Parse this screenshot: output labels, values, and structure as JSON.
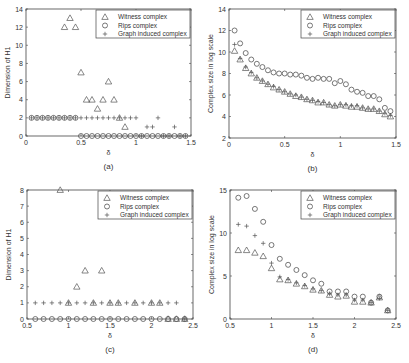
{
  "figure": {
    "panels": [
      "a",
      "b",
      "c",
      "d"
    ]
  },
  "chart_data": [
    {
      "id": "a",
      "type": "scatter",
      "caption": "(a)",
      "xlabel": "δ",
      "ylabel": "Dimension of H1",
      "xlim": [
        0,
        1.5
      ],
      "ylim": [
        0,
        14
      ],
      "xticks": [
        0,
        0.5,
        1,
        1.5
      ],
      "xtick_labels": [
        "0",
        "0.5",
        "1",
        "1.5"
      ],
      "yticks": [
        0,
        2,
        4,
        6,
        8,
        10,
        12,
        14
      ],
      "ytick_labels": [
        "0",
        "2",
        "4",
        "6",
        "8",
        "10",
        "12",
        "14"
      ],
      "legend_position": "upper right",
      "box": {
        "left": 26,
        "top": 9,
        "right": 191,
        "bottom": 136
      },
      "series": [
        {
          "name": "Witness complex",
          "marker": "triangle",
          "x": [
            0.35,
            0.4,
            0.45,
            0.5,
            0.55,
            0.6,
            0.65,
            0.7,
            0.75,
            0.8,
            0.85,
            0.9
          ],
          "y": [
            12,
            13,
            12,
            7,
            4,
            4,
            3,
            4,
            6,
            4,
            2,
            1
          ]
        },
        {
          "name": "Rips complex",
          "marker": "circle",
          "x": [
            0.05,
            0.1,
            0.15,
            0.2,
            0.25,
            0.3,
            0.35,
            0.4,
            0.45,
            0.5,
            0.55,
            0.6,
            0.65,
            0.7,
            0.75,
            0.8,
            0.85,
            0.9,
            0.95,
            1.0,
            1.05,
            1.1,
            1.15,
            1.2,
            1.25,
            1.3,
            1.35,
            1.4,
            1.45
          ],
          "y": [
            2,
            2,
            2,
            2,
            2,
            2,
            2,
            2,
            2,
            0,
            0,
            0,
            0,
            0,
            0,
            0,
            0,
            0,
            0,
            0,
            0,
            0,
            0,
            0,
            0,
            0,
            0,
            0,
            0
          ]
        },
        {
          "name": "Graph induced complex",
          "marker": "plus",
          "x": [
            0.05,
            0.1,
            0.15,
            0.2,
            0.25,
            0.3,
            0.35,
            0.4,
            0.45,
            0.5,
            0.55,
            0.6,
            0.65,
            0.7,
            0.75,
            0.8,
            0.85,
            0.9,
            0.95,
            1.0,
            1.05,
            1.1,
            1.15,
            1.2,
            1.25,
            1.3,
            1.35,
            1.4,
            1.45
          ],
          "y": [
            2,
            2,
            2,
            2,
            2,
            2,
            2,
            2,
            2,
            2,
            2,
            2,
            2,
            2,
            2,
            2,
            2,
            2,
            2,
            2,
            0,
            1,
            1,
            2,
            0,
            0,
            1,
            0,
            0
          ]
        }
      ]
    },
    {
      "id": "b",
      "type": "scatter",
      "caption": "(b)",
      "xlabel": "δ",
      "ylabel": "Complex size in log scale",
      "xlim": [
        0,
        1.5
      ],
      "ylim": [
        2,
        14
      ],
      "xticks": [
        0,
        0.5,
        1,
        1.5
      ],
      "xtick_labels": [
        "0",
        "0.5",
        "1",
        "1.5"
      ],
      "yticks": [
        2,
        4,
        6,
        8,
        10,
        12,
        14
      ],
      "ytick_labels": [
        "2",
        "4",
        "6",
        "8",
        "10",
        "12",
        "14"
      ],
      "legend_position": "upper right",
      "box": {
        "left": 229,
        "top": 9,
        "right": 396,
        "bottom": 138
      },
      "series": [
        {
          "name": "Witness complex",
          "marker": "triangle",
          "x": [
            0.05,
            0.1,
            0.15,
            0.2,
            0.25,
            0.3,
            0.35,
            0.4,
            0.45,
            0.5,
            0.55,
            0.6,
            0.65,
            0.7,
            0.75,
            0.8,
            0.85,
            0.9,
            0.95,
            1.0,
            1.05,
            1.1,
            1.15,
            1.2,
            1.25,
            1.3,
            1.35,
            1.4,
            1.45
          ],
          "y": [
            10.1,
            9.3,
            8.5,
            8.0,
            7.6,
            7.3,
            7.0,
            6.7,
            6.5,
            6.3,
            6.1,
            5.9,
            5.8,
            5.6,
            5.5,
            5.3,
            5.3,
            5.1,
            5.0,
            5.1,
            5.0,
            4.9,
            4.9,
            4.8,
            4.7,
            4.7,
            4.5,
            4.2,
            4.0
          ]
        },
        {
          "name": "Rips complex",
          "marker": "circle",
          "x": [
            0.05,
            0.1,
            0.15,
            0.2,
            0.25,
            0.3,
            0.35,
            0.4,
            0.45,
            0.5,
            0.55,
            0.6,
            0.65,
            0.7,
            0.75,
            0.8,
            0.85,
            0.9,
            0.95,
            1.0,
            1.05,
            1.1,
            1.15,
            1.2,
            1.25,
            1.3,
            1.35,
            1.4,
            1.45
          ],
          "y": [
            12.0,
            10.8,
            9.9,
            9.3,
            8.9,
            8.6,
            8.3,
            8.1,
            8.0,
            8.0,
            7.9,
            7.9,
            7.8,
            7.6,
            7.5,
            7.6,
            7.5,
            7.5,
            7.1,
            7.3,
            7.0,
            6.5,
            6.3,
            6.2,
            5.9,
            5.9,
            5.6,
            4.8,
            4.5
          ]
        },
        {
          "name": "Graph induced complex",
          "marker": "plus",
          "x": [
            0.05,
            0.1,
            0.15,
            0.2,
            0.25,
            0.3,
            0.35,
            0.4,
            0.45,
            0.5,
            0.55,
            0.6,
            0.65,
            0.7,
            0.75,
            0.8,
            0.85,
            0.9,
            0.95,
            1.0,
            1.05,
            1.1,
            1.15,
            1.2,
            1.25,
            1.3,
            1.35,
            1.4,
            1.45
          ],
          "y": [
            10.7,
            9.4,
            8.6,
            8.1,
            7.6,
            7.3,
            7.0,
            6.8,
            6.5,
            6.3,
            6.1,
            6.0,
            5.8,
            5.6,
            5.5,
            5.4,
            5.3,
            5.1,
            5.0,
            5.1,
            5.1,
            5.0,
            5.0,
            4.8,
            4.7,
            4.7,
            4.5,
            4.3,
            4.1
          ]
        }
      ]
    },
    {
      "id": "c",
      "type": "scatter",
      "caption": "(c)",
      "xlabel": "δ",
      "ylabel": "Dimension of H1",
      "xlim": [
        0.5,
        2.5
      ],
      "ylim": [
        0,
        8
      ],
      "xticks": [
        0.5,
        1,
        1.5,
        2,
        2.5
      ],
      "xtick_labels": [
        "0.5",
        "1",
        "1.5",
        "2",
        "2.5"
      ],
      "yticks": [
        0,
        1,
        2,
        3,
        4,
        5,
        6,
        7,
        8
      ],
      "ytick_labels": [
        "0",
        "1",
        "2",
        "3",
        "4",
        "5",
        "6",
        "7",
        "8"
      ],
      "legend_position": "upper right",
      "box": {
        "left": 27,
        "top": 190,
        "right": 193,
        "bottom": 319
      },
      "series": [
        {
          "name": "Witness complex",
          "marker": "triangle",
          "x": [
            0.9,
            1.0,
            1.1,
            1.2,
            1.3,
            1.4,
            1.5,
            1.6,
            1.8,
            2.0,
            2.1,
            2.2,
            2.3,
            2.4
          ],
          "y": [
            8,
            1,
            2,
            3,
            1,
            3,
            1,
            1,
            1,
            1,
            1,
            0,
            0,
            0
          ]
        },
        {
          "name": "Rips complex",
          "marker": "circle",
          "x": [
            0.6,
            0.7,
            0.8,
            0.9,
            1.0,
            1.1,
            1.2,
            1.3,
            1.4,
            1.5,
            1.6,
            1.7,
            1.8,
            1.9,
            2.0,
            2.1,
            2.2,
            2.3,
            2.4
          ],
          "y": [
            0,
            0,
            0,
            0,
            0,
            0,
            0,
            0,
            0,
            0,
            0,
            0,
            0,
            0,
            0,
            0,
            0,
            0,
            0
          ]
        },
        {
          "name": "Graph induced complex",
          "marker": "plus",
          "x": [
            0.6,
            0.7,
            0.8,
            0.9,
            1.0,
            1.1,
            1.2,
            1.3,
            1.4,
            1.5,
            1.6,
            1.7,
            1.8,
            1.9,
            2.0,
            2.1,
            2.2,
            2.3,
            2.4
          ],
          "y": [
            1,
            1,
            1,
            1,
            1,
            1,
            1,
            1,
            1,
            1,
            1,
            1,
            1,
            1,
            1,
            1,
            1,
            1,
            0
          ]
        }
      ]
    },
    {
      "id": "d",
      "type": "scatter",
      "caption": "(d)",
      "xlabel": "δ",
      "ylabel": "Complex size in log scale",
      "xlim": [
        0.5,
        2.5
      ],
      "ylim": [
        0,
        15
      ],
      "xticks": [
        0.5,
        1,
        1.5,
        2,
        2.5
      ],
      "xtick_labels": [
        "0.5",
        "1",
        "1.5",
        "2",
        "2.5"
      ],
      "yticks": [
        0,
        5,
        10,
        15
      ],
      "ytick_labels": [
        "0",
        "5",
        "10",
        "15"
      ],
      "legend_position": "upper right",
      "box": {
        "left": 230,
        "top": 190,
        "right": 396,
        "bottom": 319
      },
      "series": [
        {
          "name": "Witness complex",
          "marker": "triangle",
          "x": [
            0.6,
            0.7,
            0.8,
            0.9,
            1.0,
            1.1,
            1.2,
            1.3,
            1.4,
            1.5,
            1.6,
            1.7,
            1.8,
            1.9,
            2.0,
            2.1,
            2.2,
            2.3,
            2.4
          ],
          "y": [
            8.0,
            8.0,
            7.7,
            7.3,
            5.9,
            4.6,
            4.5,
            4.1,
            3.8,
            3.4,
            3.3,
            2.8,
            2.6,
            2.7,
            2.0,
            2.0,
            1.9,
            2.5,
            1.0
          ]
        },
        {
          "name": "Rips complex",
          "marker": "circle",
          "x": [
            0.6,
            0.7,
            0.8,
            0.9,
            1.0,
            1.1,
            1.2,
            1.3,
            1.4,
            1.5,
            1.6,
            1.7,
            1.8,
            1.9,
            2.0,
            2.1,
            2.2,
            2.3,
            2.4
          ],
          "y": [
            14.1,
            14.3,
            12.8,
            11.3,
            8.6,
            7.0,
            6.3,
            5.7,
            5.1,
            4.5,
            4.1,
            3.2,
            3.2,
            3.2,
            2.6,
            2.6,
            1.9,
            2.6,
            1.0
          ]
        },
        {
          "name": "Graph induced complex",
          "marker": "plus",
          "x": [
            0.6,
            0.7,
            0.8,
            0.9,
            1.0,
            1.1,
            1.2,
            1.3,
            1.4,
            1.5,
            1.6,
            1.7,
            1.8,
            1.9,
            2.0,
            2.1,
            2.2,
            2.3,
            2.4
          ],
          "y": [
            11.0,
            10.8,
            9.7,
            8.8,
            6.5,
            4.9,
            4.6,
            4.2,
            3.9,
            3.5,
            3.3,
            2.9,
            2.8,
            2.8,
            2.2,
            2.2,
            1.9,
            2.4,
            1.0
          ]
        }
      ]
    }
  ]
}
